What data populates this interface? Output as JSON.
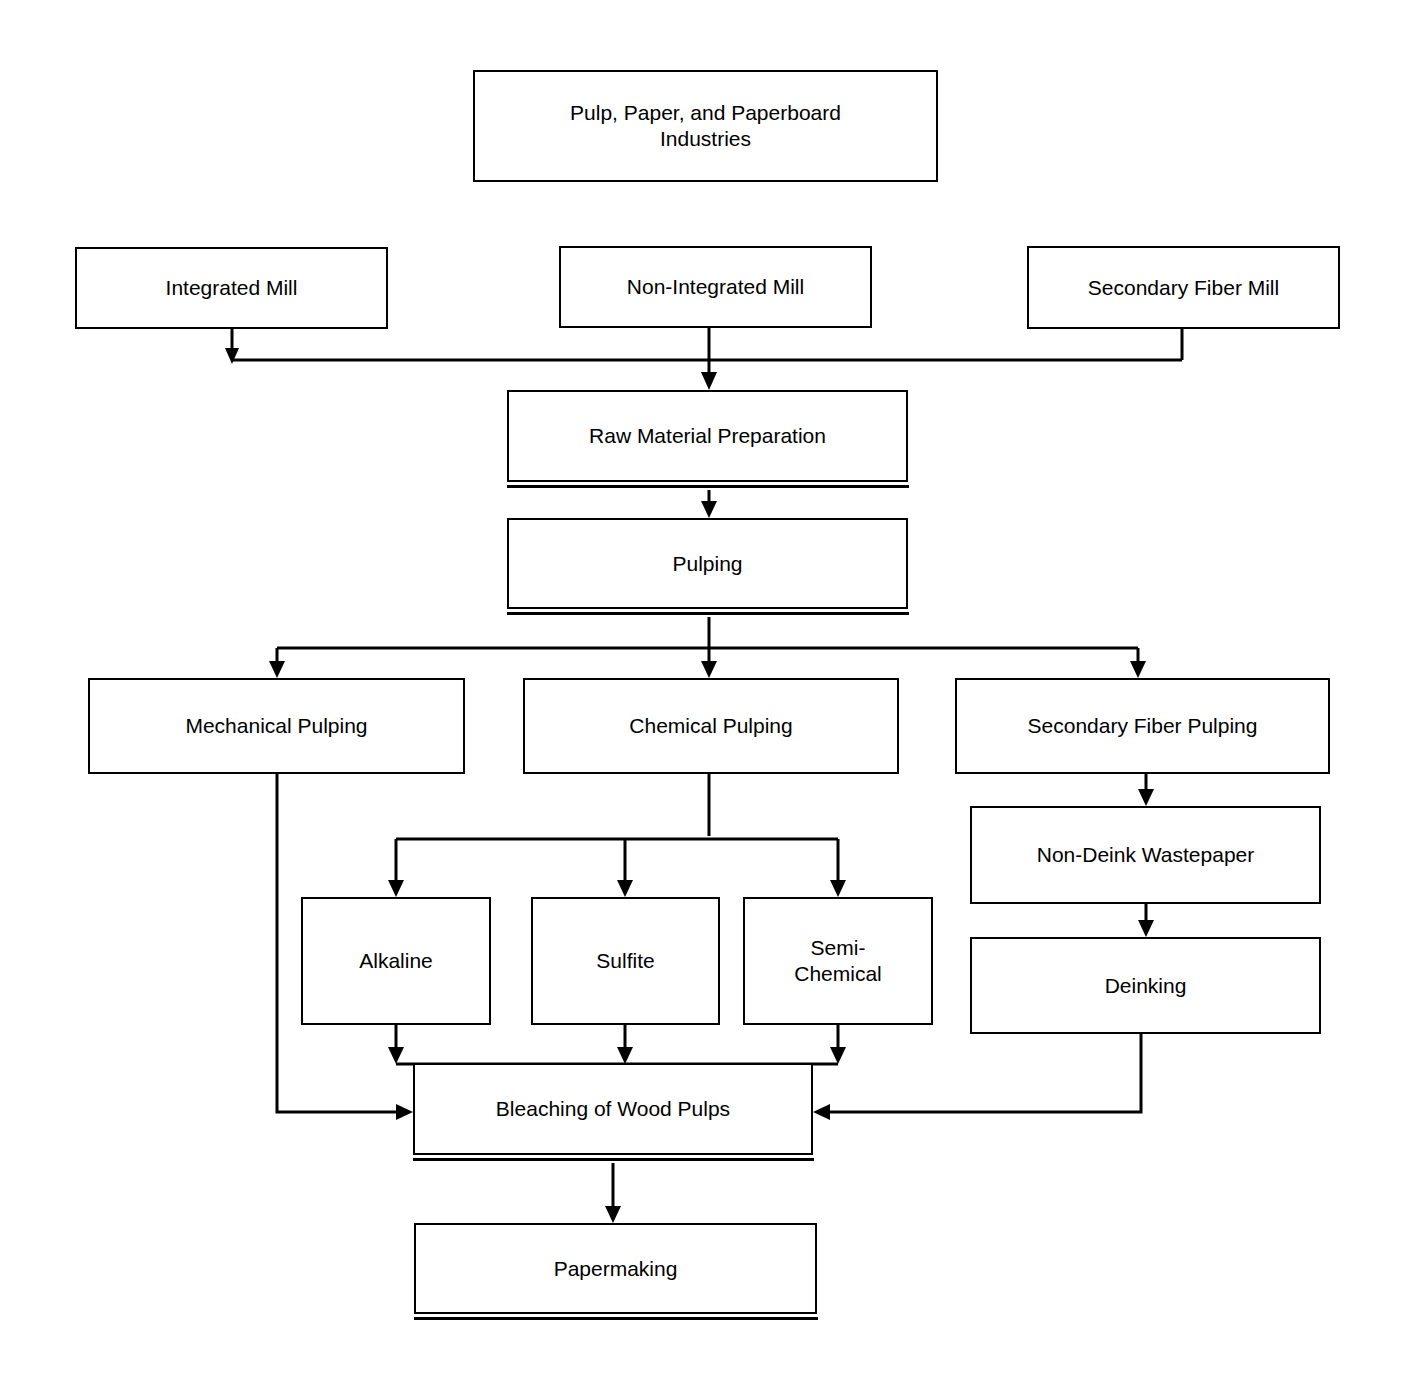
{
  "diagram": {
    "title": "Pulp, Paper, and Paperboard Industries",
    "type": "flowchart",
    "orientation": "top-down",
    "background_color": "#ffffff",
    "line_color": "#000000",
    "box_fill_color": "#ffffff",
    "nodes": {
      "root": "Pulp, Paper, and Paperboard\nIndustries",
      "integrated_mill": "Integrated Mill",
      "non_integrated_mill": "Non-Integrated Mill",
      "secondary_fiber_mill": "Secondary Fiber Mill",
      "raw_material_preparation": "Raw Material Preparation",
      "pulping": "Pulping",
      "mechanical_pulping": "Mechanical Pulping",
      "chemical_pulping": "Chemical Pulping",
      "secondary_fiber_pulping": "Secondary Fiber Pulping",
      "alkaline": "Alkaline",
      "sulfite": "Sulfite",
      "semi_chemical": "Semi-\nChemical",
      "non_deink_wastepaper": "Non-Deink Wastepaper",
      "deinking": "Deinking",
      "bleaching": "Bleaching of Wood Pulps",
      "papermaking": "Papermaking"
    },
    "edges": [
      {
        "from": "integrated_mill",
        "to": "raw_material_preparation"
      },
      {
        "from": "non_integrated_mill",
        "to": "raw_material_preparation"
      },
      {
        "from": "secondary_fiber_mill",
        "to": "raw_material_preparation"
      },
      {
        "from": "raw_material_preparation",
        "to": "pulping"
      },
      {
        "from": "pulping",
        "to": "mechanical_pulping"
      },
      {
        "from": "pulping",
        "to": "chemical_pulping"
      },
      {
        "from": "pulping",
        "to": "secondary_fiber_pulping"
      },
      {
        "from": "chemical_pulping",
        "to": "alkaline"
      },
      {
        "from": "chemical_pulping",
        "to": "sulfite"
      },
      {
        "from": "chemical_pulping",
        "to": "semi_chemical"
      },
      {
        "from": "alkaline",
        "to": "bleaching"
      },
      {
        "from": "sulfite",
        "to": "bleaching"
      },
      {
        "from": "semi_chemical",
        "to": "bleaching"
      },
      {
        "from": "mechanical_pulping",
        "to": "bleaching"
      },
      {
        "from": "secondary_fiber_pulping",
        "to": "non_deink_wastepaper"
      },
      {
        "from": "non_deink_wastepaper",
        "to": "deinking"
      },
      {
        "from": "deinking",
        "to": "bleaching"
      },
      {
        "from": "bleaching",
        "to": "papermaking"
      }
    ]
  }
}
